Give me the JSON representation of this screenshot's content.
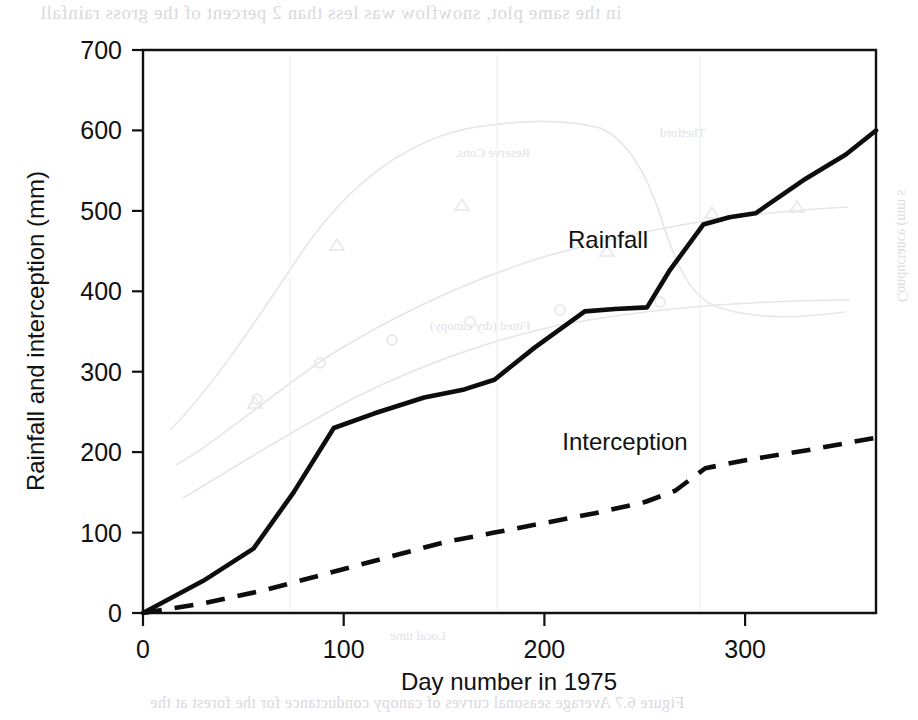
{
  "chart_data": {
    "type": "line",
    "title": "",
    "xlabel": "Day number in 1975",
    "ylabel": "Rainfall and interception (mm)",
    "xlim": [
      0,
      365
    ],
    "ylim": [
      0,
      700
    ],
    "xticks": [
      0,
      100,
      200,
      300
    ],
    "yticks": [
      0,
      100,
      200,
      300,
      400,
      500,
      600,
      700
    ],
    "xtick_labels": [
      "0",
      "100",
      "200",
      "300"
    ],
    "ytick_labels": [
      "0",
      "100",
      "200",
      "300",
      "400",
      "500",
      "600",
      "700"
    ],
    "grid": false,
    "legend_position": "inline-annotation",
    "series": [
      {
        "name": "Rainfall",
        "style": "solid",
        "color": "#0d0d0d",
        "annotation": "Rainfall",
        "x": [
          0,
          30,
          55,
          75,
          95,
          115,
          140,
          160,
          175,
          195,
          220,
          235,
          251,
          262,
          279,
          292,
          305,
          330,
          350,
          365
        ],
        "y": [
          0,
          40,
          80,
          150,
          230,
          248,
          268,
          278,
          290,
          330,
          375,
          378,
          380,
          425,
          483,
          492,
          497,
          540,
          570,
          600
        ]
      },
      {
        "name": "Interception",
        "style": "dashed",
        "color": "#0d0d0d",
        "annotation": "Interception",
        "x": [
          0,
          30,
          60,
          90,
          120,
          150,
          175,
          200,
          225,
          250,
          265,
          280,
          300,
          330,
          365
        ],
        "y": [
          0,
          12,
          28,
          48,
          68,
          88,
          100,
          112,
          124,
          138,
          152,
          180,
          190,
          202,
          218
        ]
      }
    ]
  },
  "annotations": {
    "rainfall_label": "Rainfall",
    "interception_label": "Interception"
  },
  "artifacts": {
    "top_bleed": "in the same plot, snowflow was less than 2 percent of the gross rainfall",
    "bottom_bleed": "Figure 6.7  Average seasonal curves of canopy conductance for the forest at the",
    "right_axis_bleed": "Conductance (mm s",
    "inline_bleed_1": "Reserve Cons.",
    "inline_bleed_2": "Thetford",
    "inline_bleed_3": "Fitted (dry canopy)",
    "inline_bleed_4": "Local time"
  }
}
